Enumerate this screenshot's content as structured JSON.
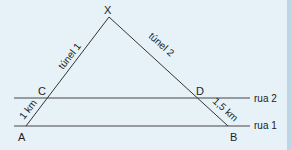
{
  "diagram": {
    "points": {
      "X": "X",
      "A": "A",
      "B": "B",
      "C": "C",
      "D": "D"
    },
    "labels": {
      "tunnel1": "túnel 1",
      "tunnel2": "túnel 2",
      "ac_length": "1 km",
      "db_length": "1,5 km",
      "street1": "rua 1",
      "street2": "rua 2"
    },
    "colors": {
      "background": "#e6f2f8",
      "lines": "#333333",
      "border": "#bdd6e6"
    }
  }
}
